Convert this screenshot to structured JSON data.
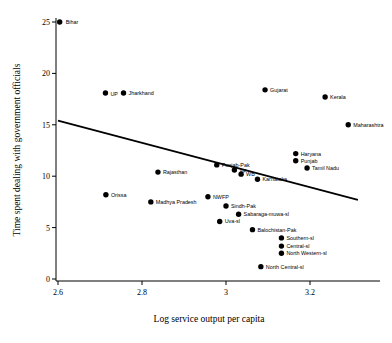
{
  "chart_data": {
    "type": "scatter",
    "title": "",
    "xlabel": "Log service output per capita",
    "ylabel": "Time spent dealing with government officials",
    "xlim": [
      2.55,
      3.35
    ],
    "ylim": [
      0,
      26
    ],
    "xticks": [
      "2.6",
      "2.8",
      "3",
      "3.2"
    ],
    "xtickvalues": [
      2.6,
      2.8,
      3.0,
      3.2
    ],
    "yticks": [
      "0",
      "5",
      "10",
      "15",
      "20",
      "25"
    ],
    "ytickvalues": [
      0,
      5,
      10,
      15,
      20,
      25
    ],
    "grid": false,
    "legend": "none",
    "marker": "filled-circle",
    "points": [
      {
        "label": "Bihar",
        "x": 2.604,
        "y": 25.0,
        "lx": 6,
        "ly": 2.0
      },
      {
        "label": "UP",
        "x": 2.713,
        "y": 18.1,
        "lx": 5,
        "ly": 2.6
      },
      {
        "label": "Jharkhand",
        "x": 2.756,
        "y": 18.1,
        "lx": 5,
        "ly": 2.0
      },
      {
        "label": "Gujarat",
        "x": 3.093,
        "y": 18.4,
        "lx": 5,
        "ly": 2.0
      },
      {
        "label": "Kerala",
        "x": 3.236,
        "y": 17.7,
        "lx": 5,
        "ly": 2.0
      },
      {
        "label": "Maharashtra",
        "x": 3.291,
        "y": 15.0,
        "lx": 5,
        "ly": 2.0
      },
      {
        "label": "Punjab-Pak",
        "x": 2.978,
        "y": 11.1,
        "lx": 5,
        "ly": 2.0
      },
      {
        "label": "AP",
        "x": 3.02,
        "y": 10.6,
        "lx": 5,
        "ly": 2.6
      },
      {
        "label": "WB",
        "x": 3.036,
        "y": 10.2,
        "lx": 5,
        "ly": 2.0
      },
      {
        "label": "Karnataka",
        "x": 3.075,
        "y": 9.7,
        "lx": 5,
        "ly": 2.0
      },
      {
        "label": "Haryana",
        "x": 3.166,
        "y": 12.2,
        "lx": 5,
        "ly": 2.0
      },
      {
        "label": "Punjab",
        "x": 3.166,
        "y": 11.5,
        "lx": 5,
        "ly": 2.0
      },
      {
        "label": "Tamil Nadu",
        "x": 3.193,
        "y": 10.8,
        "lx": 5,
        "ly": 2.0
      },
      {
        "label": "Orissa",
        "x": 2.714,
        "y": 8.2,
        "lx": 5,
        "ly": 2.0
      },
      {
        "label": "Rajasthan",
        "x": 2.838,
        "y": 10.4,
        "lx": 5,
        "ly": 2.0
      },
      {
        "label": "Madhya Pradesh",
        "x": 2.821,
        "y": 7.5,
        "lx": 5,
        "ly": 2.0
      },
      {
        "label": "NWFP",
        "x": 2.957,
        "y": 8.0,
        "lx": 5,
        "ly": 2.0
      },
      {
        "label": "Sindh-Pak",
        "x": 3.0,
        "y": 7.1,
        "lx": 5,
        "ly": 2.0
      },
      {
        "label": "Sabaraga-muwa-sl",
        "x": 3.03,
        "y": 6.3,
        "lx": 5,
        "ly": 2.0
      },
      {
        "label": "Uva-sl",
        "x": 2.985,
        "y": 5.6,
        "lx": 5,
        "ly": 2.0
      },
      {
        "label": "Balochistan-Pak",
        "x": 3.063,
        "y": 4.8,
        "lx": 5,
        "ly": 2.0
      },
      {
        "label": "Southern-sl",
        "x": 3.132,
        "y": 4.0,
        "lx": 5,
        "ly": 2.0
      },
      {
        "label": "Central-sl",
        "x": 3.132,
        "y": 3.2,
        "lx": 5,
        "ly": 2.0
      },
      {
        "label": "North Western-sl",
        "x": 3.132,
        "y": 2.5,
        "lx": 5,
        "ly": 2.0
      },
      {
        "label": "North Central-sl",
        "x": 3.083,
        "y": 1.2,
        "lx": 5,
        "ly": 2.0
      }
    ],
    "fit_line": {
      "name": "linear-fit",
      "x1": 2.6,
      "y1": 15.4,
      "x2": 3.314,
      "y2": 7.7
    }
  }
}
